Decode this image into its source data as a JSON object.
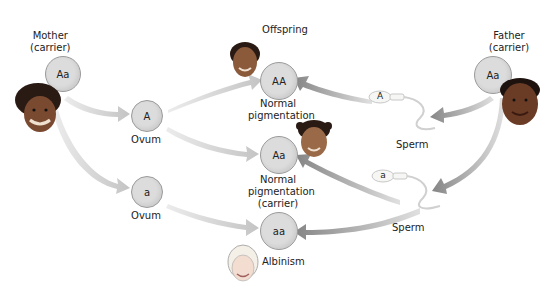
{
  "parents": {
    "mother": {
      "label": "Mother",
      "status": "(carrier)",
      "genotype": "Aa"
    },
    "father": {
      "label": "Father",
      "status": "(carrier)",
      "genotype": "Aa"
    }
  },
  "gametes": {
    "ovum_A": {
      "allele": "A",
      "label": "Ovum"
    },
    "ovum_a": {
      "allele": "a",
      "label": "Ovum"
    },
    "sperm_A": {
      "allele": "A",
      "label": "Sperm"
    },
    "sperm_a": {
      "allele": "a",
      "label": "Sperm"
    }
  },
  "offspring": {
    "heading": "Offspring",
    "AA": {
      "genotype": "AA",
      "line1": "Normal",
      "line2": "pigmentation"
    },
    "Aa": {
      "genotype": "Aa",
      "line1": "Normal",
      "line2": "pigmentation",
      "line3": "(carrier)"
    },
    "aa": {
      "genotype": "aa",
      "line1": "Albinism"
    }
  },
  "colors": {
    "maternal_arrow": "#c8c8c8",
    "paternal_arrow": "#8c8c8c",
    "circle_fill": "#dcdcdc",
    "circle_border": "#9a9a9a"
  }
}
